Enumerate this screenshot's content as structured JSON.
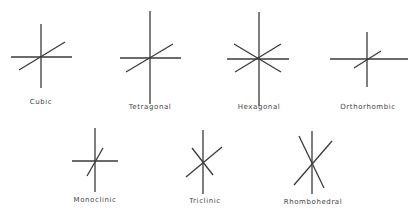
{
  "colors": {
    "line": "#3a3a3a",
    "background": "#ffffff"
  },
  "systems": [
    {
      "name": "Cubic",
      "label_pos": [
        41,
        102
      ],
      "lines": [
        [
          41,
          24,
          41,
          88
        ],
        [
          11,
          57,
          72,
          57
        ],
        [
          19,
          70,
          65,
          42
        ]
      ]
    },
    {
      "name": "Tetragonal",
      "label_pos": [
        150,
        107
      ],
      "lines": [
        [
          150,
          11,
          150,
          104
        ],
        [
          120,
          58,
          181,
          58
        ],
        [
          126,
          72,
          173,
          44
        ]
      ]
    },
    {
      "name": "Hexagonal",
      "label_pos": [
        259,
        107
      ],
      "lines": [
        [
          259,
          12,
          259,
          106
        ],
        [
          227,
          59,
          289,
          59
        ],
        [
          234,
          44,
          281,
          72
        ],
        [
          235,
          72,
          281,
          44
        ]
      ]
    },
    {
      "name": "Orthorhombic",
      "label_pos": [
        368,
        107
      ],
      "lines": [
        [
          367,
          32,
          367,
          87
        ],
        [
          330,
          59,
          408,
          59
        ],
        [
          354,
          68,
          381,
          51
        ]
      ]
    },
    {
      "name": "Monoclinic",
      "label_pos": [
        95,
        200
      ],
      "lines": [
        [
          95,
          128,
          95,
          192
        ],
        [
          72,
          161,
          118,
          161
        ],
        [
          87,
          176,
          103,
          148
        ]
      ]
    },
    {
      "name": "Triclinic",
      "label_pos": [
        205,
        201
      ],
      "lines": [
        [
          203,
          130,
          203,
          194
        ],
        [
          186,
          177,
          222,
          147
        ],
        [
          192,
          148,
          213,
          175
        ]
      ]
    },
    {
      "name": "Rhombohedral",
      "label_pos": [
        313,
        202
      ],
      "lines": [
        [
          312,
          131,
          312,
          194
        ],
        [
          299,
          136,
          324,
          188
        ],
        [
          294,
          185,
          332,
          141
        ]
      ]
    }
  ]
}
